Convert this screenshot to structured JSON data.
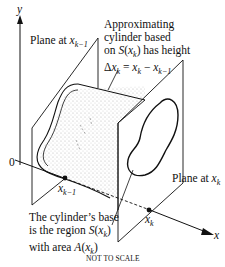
{
  "diagram": {
    "axes": {
      "y_label": "y",
      "x_label": "x",
      "origin_label": "0"
    },
    "labels": {
      "plane_left": {
        "text": "Plane at ",
        "var": "x",
        "sub": "k−1"
      },
      "plane_right": {
        "text": "Plane at ",
        "var": "x",
        "sub": "k"
      },
      "cylinder_note": {
        "line1": "Approximating",
        "line2": "cylinder based",
        "line3_pre": "on ",
        "line3_func": "S",
        "line3_arg": "x",
        "line3_sub": "k",
        "line3_post": " has height",
        "line4": "Δx_k = x_k − x_{k−1}"
      },
      "point_left": {
        "var": "x",
        "sub": "k−1"
      },
      "point_right": {
        "var": "x",
        "sub": "k"
      },
      "base_note": {
        "line1": "The cylinder’s base",
        "line2_pre": "is the region ",
        "line2_func": "S",
        "line2_arg": "x",
        "line2_sub": "k",
        "line3_pre": "with area ",
        "line3_func": "A",
        "line3_arg": "x",
        "line3_sub": "k"
      },
      "footer": "NOT TO SCALE"
    },
    "colors": {
      "ink": "#111111",
      "shading": "#cfcfcf"
    }
  }
}
